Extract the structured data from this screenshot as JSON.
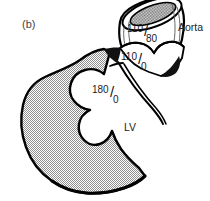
{
  "figure": {
    "panel_label": "(b)"
  },
  "labels": {
    "aorta": "Aorta",
    "left_ventricle": "LV"
  },
  "pressures": {
    "aortic": {
      "systolic": "110",
      "diastolic": "80",
      "separator": "/"
    },
    "valve_outflow": {
      "systolic": "110",
      "diastolic": "0",
      "separator": "/"
    },
    "ventricular": {
      "systolic": "180",
      "diastolic": "0",
      "separator": "/"
    }
  },
  "colors": {
    "background": "#ffffff",
    "outline": "#000000",
    "myocardium_fill": "#b4b4b4",
    "vessel_fill": "#ffffff",
    "lumen_shade": "#9a9a9a",
    "dark_accent": "#1a1a1a",
    "text": "#1a1a1a"
  }
}
